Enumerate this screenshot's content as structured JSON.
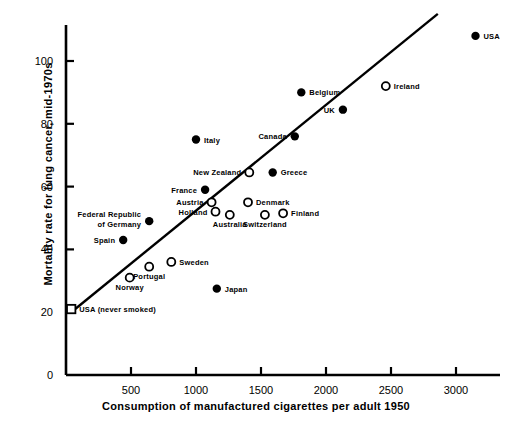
{
  "chart_data": {
    "type": "scatter",
    "title": "",
    "xlabel": "Consumption of manufactured cigarettes per adult 1950",
    "ylabel": "Mortality rate for lung cancer, mid-1970s",
    "xlim": [
      0,
      3350
    ],
    "ylim": [
      0,
      113
    ],
    "xticks": [
      500,
      1000,
      1500,
      2000,
      2500,
      3000
    ],
    "xtick_labels": [
      "500",
      "1000",
      "1500",
      "2000",
      "2500",
      "3000"
    ],
    "yticks": [
      0,
      20,
      40,
      60,
      80,
      100
    ],
    "ytick_labels": [
      "0",
      "20",
      "40",
      "60",
      "80",
      "100"
    ],
    "grid": false,
    "legend": "none",
    "marker_types": {
      "filled": "filled-circle",
      "open": "open-circle",
      "special": "open-square"
    },
    "trend_line": {
      "label": "regression line",
      "x_start": 40,
      "y_start": 20,
      "x_end": 2860,
      "y_end": 115
    },
    "points": [
      {
        "name": "USA",
        "x": 3150,
        "y": 108,
        "marker": "filled",
        "label_pos": "right"
      },
      {
        "name": "Ireland",
        "x": 2460,
        "y": 92,
        "marker": "open",
        "label_pos": "right"
      },
      {
        "name": "UK",
        "x": 2130,
        "y": 84.5,
        "marker": "filled",
        "label_pos": "left"
      },
      {
        "name": "Belgium",
        "x": 1810,
        "y": 90,
        "marker": "filled",
        "label_pos": "right"
      },
      {
        "name": "Canada",
        "x": 1760,
        "y": 76,
        "marker": "filled",
        "label_pos": "left"
      },
      {
        "name": "Italy",
        "x": 1000,
        "y": 75,
        "marker": "filled",
        "label_pos": "right"
      },
      {
        "name": "Greece",
        "x": 1590,
        "y": 64.5,
        "marker": "filled",
        "label_pos": "right"
      },
      {
        "name": "New Zealand",
        "x": 1410,
        "y": 64.5,
        "marker": "open",
        "label_pos": "left"
      },
      {
        "name": "France",
        "x": 1070,
        "y": 59,
        "marker": "filled",
        "label_pos": "left"
      },
      {
        "name": "Austria",
        "x": 1120,
        "y": 55,
        "marker": "open",
        "label_pos": "left"
      },
      {
        "name": "Holland",
        "x": 1150,
        "y": 52,
        "marker": "open",
        "label_pos": "left"
      },
      {
        "name": "Denmark",
        "x": 1400,
        "y": 55,
        "marker": "open",
        "label_pos": "right"
      },
      {
        "name": "Australia",
        "x": 1260,
        "y": 51,
        "marker": "open",
        "label_pos": "below"
      },
      {
        "name": "Switzerland",
        "x": 1530,
        "y": 51,
        "marker": "open",
        "label_pos": "below"
      },
      {
        "name": "Finland",
        "x": 1670,
        "y": 51.5,
        "marker": "open",
        "label_pos": "right"
      },
      {
        "name": "Federal Republic of Germany",
        "x": 640,
        "y": 49,
        "marker": "filled",
        "label_pos": "left"
      },
      {
        "name": "Spain",
        "x": 440,
        "y": 43,
        "marker": "filled",
        "label_pos": "left"
      },
      {
        "name": "Sweden",
        "x": 810,
        "y": 36,
        "marker": "open",
        "label_pos": "right"
      },
      {
        "name": "Portugal",
        "x": 640,
        "y": 34.5,
        "marker": "open",
        "label_pos": "below"
      },
      {
        "name": "Norway",
        "x": 490,
        "y": 31,
        "marker": "open",
        "label_pos": "below"
      },
      {
        "name": "Japan",
        "x": 1160,
        "y": 27.5,
        "marker": "filled",
        "label_pos": "right"
      },
      {
        "name": "USA (never smoked)",
        "x": 40,
        "y": 21,
        "marker": "special",
        "label_pos": "right"
      }
    ]
  },
  "axes": {
    "x_title": "Consumption of manufactured cigarettes per adult 1950",
    "y_title": "Mortality rate for lung cancer, mid-1970s"
  },
  "colors": {
    "ink": "#000000",
    "background": "#ffffff"
  }
}
